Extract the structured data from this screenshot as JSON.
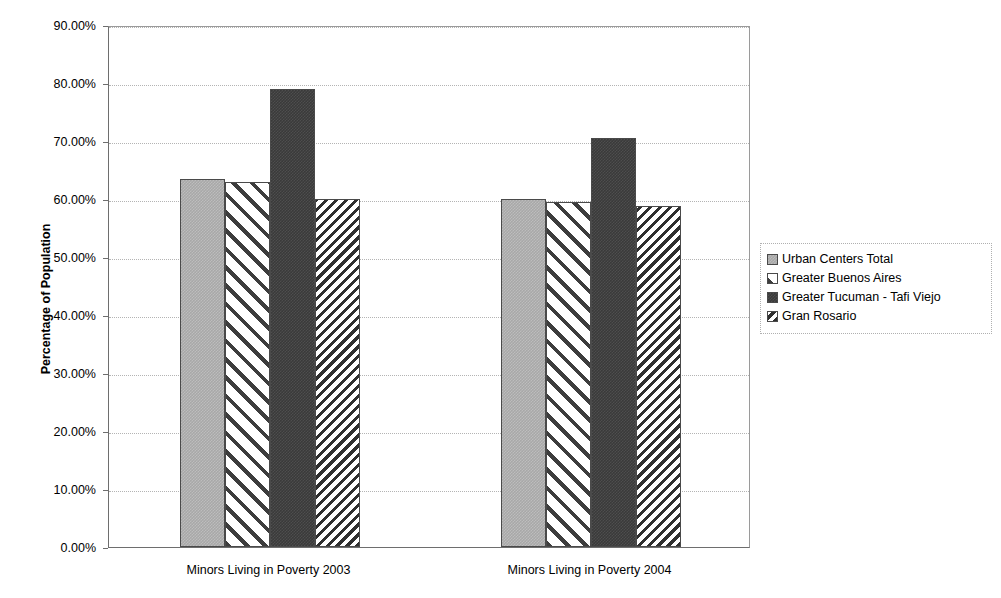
{
  "chart_data": {
    "type": "bar",
    "title": "",
    "xlabel": "",
    "ylabel": "Percentage of Population",
    "categories": [
      "Minors Living in Poverty 2003",
      "Minors Living in Poverty 2004"
    ],
    "series": [
      {
        "name": "Urban Centers Total",
        "values": [
          63.4,
          60.0
        ],
        "pattern": "solid-gray",
        "color": "#a8a8a8"
      },
      {
        "name": "Greater Buenos Aires",
        "values": [
          63.0,
          59.4
        ],
        "pattern": "diagonal-up-stripes",
        "color": "#3d3d3d"
      },
      {
        "name": "Greater Tucuman - Tafi Viejo",
        "values": [
          79.0,
          70.6
        ],
        "pattern": "solid-dark",
        "color": "#3a3a3a"
      },
      {
        "name": "Gran Rosario",
        "values": [
          60.0,
          58.8
        ],
        "pattern": "diagonal-down-dense-stripes",
        "color": "#2f2f2f"
      }
    ],
    "ylim": [
      0,
      90
    ],
    "ytick_values": [
      0,
      10,
      20,
      30,
      40,
      50,
      60,
      70,
      80,
      90
    ],
    "ytick_labels": [
      "0.00%",
      "10.00%",
      "20.00%",
      "30.00%",
      "40.00%",
      "50.00%",
      "60.00%",
      "70.00%",
      "80.00%",
      "90.00%"
    ],
    "grid": true,
    "grid_axis": "y",
    "legend_position": "right",
    "legend_entries": [
      "Urban Centers Total",
      "Greater Buenos Aires",
      "Greater Tucuman - Tafi Viejo",
      "Gran Rosario"
    ]
  },
  "colors": {
    "axis": "#6e6e6e",
    "grid": "#b4b4b4",
    "background": "#ffffff",
    "text": "#000000",
    "bar_border": "#4a4a4a",
    "legend_border": "#b0b0b0"
  }
}
